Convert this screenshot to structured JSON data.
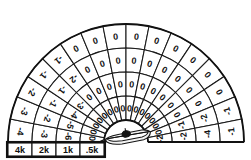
{
  "display": {
    "title": "Sonar Bearing-Range Signal Grid",
    "center_icon": "submarine-icon",
    "background_color": "#ffffff",
    "line_color": "#111111"
  },
  "legend": {
    "name": "range-scale-legend",
    "labels": [
      "4k",
      "2k",
      "1k",
      ".5k"
    ]
  },
  "chart_data": {
    "type": "heatmap",
    "xlabel": "Bearing sector",
    "ylabel": "Range ring",
    "grid": true,
    "legend_position": "bottom-left",
    "geometry": {
      "shape": "semicircular-polar",
      "center_x": 126,
      "center_y": 142,
      "start_angle_deg": 180,
      "end_angle_deg": 360,
      "sector_count": 16,
      "ring_count": 4
    },
    "ring_labels": [
      "4k",
      "2k",
      "1k",
      ".5k"
    ],
    "ring_radii": [
      118,
      94,
      70,
      46,
      22
    ],
    "categories": [
      "S1",
      "S2",
      "S3",
      "S4",
      "S5",
      "S6",
      "S7",
      "S8",
      "S9",
      "S10",
      "S11",
      "S12",
      "S13",
      "S14",
      "S15",
      "S16"
    ],
    "series": [
      {
        "name": "4k",
        "values": [
          -4,
          -3,
          -2,
          -1,
          0,
          0,
          0,
          0,
          0,
          0,
          0,
          0,
          0,
          0,
          -1,
          -1
        ]
      },
      {
        "name": "2k",
        "values": [
          -3,
          -2,
          -1,
          -1,
          -2,
          0,
          0,
          0,
          0,
          0,
          0,
          0,
          0,
          0,
          -2,
          -4
        ]
      },
      {
        "name": "1k",
        "values": [
          -6,
          -5,
          -4,
          -3,
          0,
          0,
          0,
          0,
          0,
          0,
          0,
          0,
          0,
          0,
          -1,
          -2
        ]
      },
      {
        "name": ".5k",
        "values": [
          0,
          0,
          0,
          0,
          0,
          0,
          0,
          0,
          0,
          0,
          0,
          0,
          0,
          0,
          0,
          -2
        ]
      }
    ],
    "cells": [
      {
        "ring": 0,
        "sector": 0,
        "value": "-4"
      },
      {
        "ring": 0,
        "sector": 1,
        "value": "-3"
      },
      {
        "ring": 0,
        "sector": 2,
        "value": "-2"
      },
      {
        "ring": 0,
        "sector": 3,
        "value": "-1"
      },
      {
        "ring": 0,
        "sector": 4,
        "value": "-1"
      },
      {
        "ring": 0,
        "sector": 5,
        "value": "0"
      },
      {
        "ring": 0,
        "sector": 6,
        "value": "0"
      },
      {
        "ring": 0,
        "sector": 7,
        "value": "0"
      },
      {
        "ring": 0,
        "sector": 8,
        "value": "0"
      },
      {
        "ring": 0,
        "sector": 9,
        "value": "0"
      },
      {
        "ring": 0,
        "sector": 10,
        "value": "0"
      },
      {
        "ring": 0,
        "sector": 11,
        "value": "0"
      },
      {
        "ring": 0,
        "sector": 12,
        "value": "0"
      },
      {
        "ring": 0,
        "sector": 13,
        "value": "0"
      },
      {
        "ring": 0,
        "sector": 14,
        "value": "-1"
      },
      {
        "ring": 0,
        "sector": 15,
        "value": "-1"
      },
      {
        "ring": 1,
        "sector": 0,
        "value": "-3"
      },
      {
        "ring": 1,
        "sector": 1,
        "value": "-2"
      },
      {
        "ring": 1,
        "sector": 2,
        "value": "-1"
      },
      {
        "ring": 1,
        "sector": 3,
        "value": "-1"
      },
      {
        "ring": 1,
        "sector": 4,
        "value": "-2"
      },
      {
        "ring": 1,
        "sector": 5,
        "value": "0"
      },
      {
        "ring": 1,
        "sector": 6,
        "value": "0"
      },
      {
        "ring": 1,
        "sector": 7,
        "value": "0"
      },
      {
        "ring": 1,
        "sector": 8,
        "value": "0"
      },
      {
        "ring": 1,
        "sector": 9,
        "value": "0"
      },
      {
        "ring": 1,
        "sector": 10,
        "value": "0"
      },
      {
        "ring": 1,
        "sector": 11,
        "value": "0"
      },
      {
        "ring": 1,
        "sector": 12,
        "value": "0"
      },
      {
        "ring": 1,
        "sector": 13,
        "value": "0"
      },
      {
        "ring": 1,
        "sector": 14,
        "value": "-2"
      },
      {
        "ring": 1,
        "sector": 15,
        "value": "-4"
      },
      {
        "ring": 2,
        "sector": 0,
        "value": "-6"
      },
      {
        "ring": 2,
        "sector": 1,
        "value": "-5"
      },
      {
        "ring": 2,
        "sector": 2,
        "value": "-4"
      },
      {
        "ring": 2,
        "sector": 3,
        "value": "-3"
      },
      {
        "ring": 2,
        "sector": 4,
        "value": "0"
      },
      {
        "ring": 2,
        "sector": 5,
        "value": "0"
      },
      {
        "ring": 2,
        "sector": 6,
        "value": "0"
      },
      {
        "ring": 2,
        "sector": 7,
        "value": "0"
      },
      {
        "ring": 2,
        "sector": 8,
        "value": "0"
      },
      {
        "ring": 2,
        "sector": 9,
        "value": "0"
      },
      {
        "ring": 2,
        "sector": 10,
        "value": "0"
      },
      {
        "ring": 2,
        "sector": 11,
        "value": "0"
      },
      {
        "ring": 2,
        "sector": 12,
        "value": "0"
      },
      {
        "ring": 2,
        "sector": 13,
        "value": "0"
      },
      {
        "ring": 2,
        "sector": 14,
        "value": "-1"
      },
      {
        "ring": 2,
        "sector": 15,
        "value": "-2"
      },
      {
        "ring": 3,
        "sector": 0,
        "value": "0"
      },
      {
        "ring": 3,
        "sector": 1,
        "value": "0"
      },
      {
        "ring": 3,
        "sector": 2,
        "value": "0"
      },
      {
        "ring": 3,
        "sector": 3,
        "value": "0"
      },
      {
        "ring": 3,
        "sector": 4,
        "value": "0"
      },
      {
        "ring": 3,
        "sector": 5,
        "value": "0"
      },
      {
        "ring": 3,
        "sector": 6,
        "value": "0"
      },
      {
        "ring": 3,
        "sector": 7,
        "value": "0"
      },
      {
        "ring": 3,
        "sector": 8,
        "value": "0"
      },
      {
        "ring": 3,
        "sector": 9,
        "value": "0"
      },
      {
        "ring": 3,
        "sector": 10,
        "value": "0"
      },
      {
        "ring": 3,
        "sector": 11,
        "value": "0"
      },
      {
        "ring": 3,
        "sector": 12,
        "value": "0"
      },
      {
        "ring": 3,
        "sector": 13,
        "value": "0"
      },
      {
        "ring": 3,
        "sector": 14,
        "value": "0"
      },
      {
        "ring": 3,
        "sector": 15,
        "value": "-2"
      }
    ]
  }
}
